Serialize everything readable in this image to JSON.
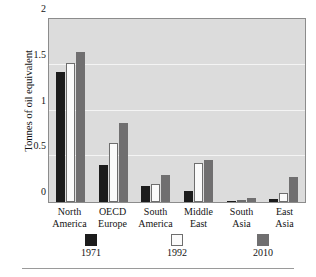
{
  "chart_data": {
    "type": "bar",
    "title": "",
    "subtitle": "",
    "xlabel": "",
    "ylabel": "Tonnes of oil equivalent",
    "ylim": [
      0,
      2
    ],
    "yticks": [
      "0",
      "0.5",
      "1",
      "1.5",
      "2"
    ],
    "ytick_values": [
      0,
      0.5,
      1,
      1.5,
      2
    ],
    "grid": "horizontal",
    "legend_position": "bottom",
    "categories": [
      "North\nAmerica",
      "OECD\nEurope",
      "South\nAmerica",
      "Middle\nEast",
      "South\nAsia",
      "East\nAsia"
    ],
    "category_lines": [
      [
        "North",
        "America"
      ],
      [
        "OECD",
        "Europe"
      ],
      [
        "South",
        "America"
      ],
      [
        "Middle",
        "East"
      ],
      [
        "South",
        "Asia"
      ],
      [
        "East",
        "Asia"
      ]
    ],
    "series": [
      {
        "name": "1971",
        "color": "#1c1c1c",
        "values": [
          1.42,
          0.4,
          0.17,
          0.12,
          0.01,
          0.03
        ]
      },
      {
        "name": "1992",
        "color": "#fbfbfb",
        "values": [
          1.52,
          0.64,
          0.2,
          0.43,
          0.02,
          0.1
        ]
      },
      {
        "name": "2010",
        "color": "#706f70",
        "values": [
          1.64,
          0.86,
          0.29,
          0.46,
          0.04,
          0.27
        ]
      }
    ],
    "colors": {
      "plot_background": "#dcdcdc",
      "gridline": "#f4f4f4",
      "axis_frame": "#8c8c8c",
      "text": "#141414",
      "page_background": "#ffffff"
    }
  },
  "legend": {
    "items": [
      {
        "label": "1971",
        "swatch": "black-square-swatch"
      },
      {
        "label": "1992",
        "swatch": "white-square-swatch"
      },
      {
        "label": "2010",
        "swatch": "gray-square-swatch"
      }
    ]
  }
}
